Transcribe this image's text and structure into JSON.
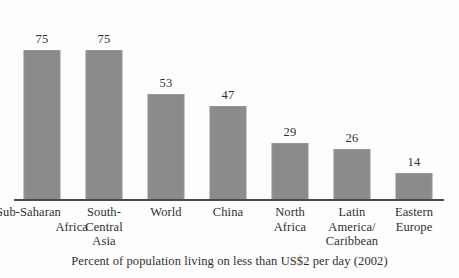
{
  "chart_data": {
    "type": "bar",
    "title": "",
    "subtitle": "",
    "caption": "Percent of population living on less than US$2 per day (2002)",
    "xlabel": "",
    "ylabel": "",
    "ylim": [
      0,
      85
    ],
    "grid": false,
    "legend": false,
    "bar_color": "#8b8b8b",
    "axis_color": "#4a4a4a",
    "background": "#fdfdfd",
    "value_labels_shown": true,
    "categories": [
      "Sub-Saharan Africa",
      "South-Central Asia",
      "World",
      "China",
      "North Africa",
      "Latin America/Caribbean",
      "Eastern Europe"
    ],
    "values": [
      75,
      75,
      53,
      47,
      29,
      26,
      14
    ],
    "bars": [
      {
        "label_lines": [
          "Sub-Saharan",
          "Africa"
        ],
        "label_style": "two-line-split",
        "value": 75,
        "value_text": "75"
      },
      {
        "label_lines": [
          "South-",
          "Central",
          "Asia"
        ],
        "label_style": "centered",
        "value": 75,
        "value_text": "75"
      },
      {
        "label_lines": [
          "World"
        ],
        "label_style": "centered",
        "value": 53,
        "value_text": "53"
      },
      {
        "label_lines": [
          "China"
        ],
        "label_style": "centered",
        "value": 47,
        "value_text": "47"
      },
      {
        "label_lines": [
          "North",
          "Africa"
        ],
        "label_style": "centered",
        "value": 29,
        "value_text": "29"
      },
      {
        "label_lines": [
          "Latin",
          "America/",
          "Caribbean"
        ],
        "label_style": "centered",
        "value": 26,
        "value_text": "26"
      },
      {
        "label_lines": [
          "Eastern",
          "Europe"
        ],
        "label_style": "centered",
        "value": 14,
        "value_text": "14"
      }
    ]
  }
}
